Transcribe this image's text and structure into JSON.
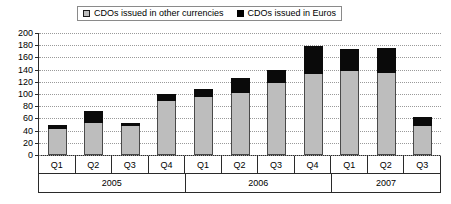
{
  "legend": {
    "entries": [
      {
        "label": "CDOs issued in other currencies",
        "swatch": "gray-square-icon",
        "color": "#bdbdbd"
      },
      {
        "label": "CDOs issued in Euros",
        "swatch": "black-square-icon",
        "color": "#000000"
      }
    ]
  },
  "axis": {
    "y_ticks": [
      "200",
      "180",
      "160",
      "140",
      "120",
      "100",
      "80",
      "60",
      "40",
      "20",
      "0"
    ],
    "quarters": [
      "Q1",
      "Q2",
      "Q3",
      "Q4",
      "Q1",
      "Q2",
      "Q3",
      "Q4",
      "Q1",
      "Q2",
      "Q3"
    ],
    "years": [
      {
        "label": "2005",
        "span": 4
      },
      {
        "label": "2006",
        "span": 4
      },
      {
        "label": "2007",
        "span": 3
      }
    ]
  },
  "chart_data": {
    "type": "bar",
    "title": "",
    "subtitle": "",
    "xlabel": "",
    "ylabel": "",
    "ylim": [
      0,
      200
    ],
    "ytick_step": 20,
    "grid": true,
    "stacked": true,
    "legend_position": "top",
    "categories": [
      "Q1",
      "Q2",
      "Q3",
      "Q4",
      "Q1",
      "Q2",
      "Q3",
      "Q4",
      "Q1",
      "Q2",
      "Q3"
    ],
    "category_groups": [
      "2005",
      "2005",
      "2005",
      "2005",
      "2006",
      "2006",
      "2006",
      "2006",
      "2007",
      "2007",
      "2007"
    ],
    "series": [
      {
        "name": "CDOs issued in other currencies",
        "color": "#bdbdbd",
        "values": [
          42,
          53,
          47,
          88,
          95,
          101,
          118,
          133,
          138,
          135,
          47
        ]
      },
      {
        "name": "CDOs issued in Euros",
        "color": "#000000",
        "values": [
          8,
          19,
          5,
          12,
          13,
          25,
          22,
          45,
          36,
          41,
          16
        ]
      }
    ],
    "totals": [
      50,
      72,
      52,
      100,
      108,
      126,
      140,
      178,
      174,
      176,
      63
    ]
  }
}
